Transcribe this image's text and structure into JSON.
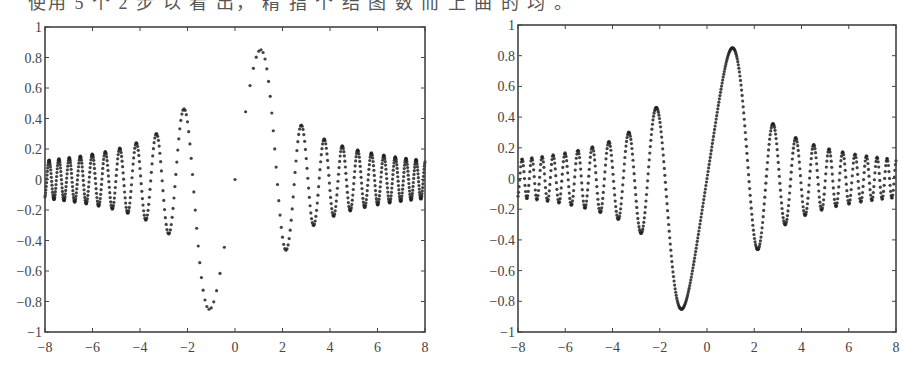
{
  "caption": "使用 5 个 2 步 以 看 出， 精 指 个 结 图 数 而 上 曲 的 均 。",
  "chart_data": [
    {
      "type": "scatter",
      "title": "",
      "xlabel": "",
      "ylabel": "",
      "function": "sin(x^2)/x",
      "sampling": "uniform-in-x-squared",
      "n_points": 640,
      "xlim": [
        -8,
        8
      ],
      "ylim": [
        -1,
        1
      ],
      "xticks": [
        -8,
        -6,
        -4,
        -2,
        0,
        2,
        4,
        6,
        8
      ],
      "yticks": [
        1,
        0.8,
        0.6,
        0.4,
        0.2,
        0,
        -0.2,
        -0.4,
        -0.6,
        -0.8,
        -1
      ],
      "ytick_labels": [
        "1",
        "0.8",
        "0.6",
        "0.4",
        "0.2",
        "0",
        "−0.2",
        "−0.4",
        "−0.6",
        "−0.8",
        "−1"
      ],
      "xtick_labels": [
        "−8",
        "−6",
        "−4",
        "−2",
        "0",
        "2",
        "4",
        "6",
        "8"
      ],
      "grid": false,
      "key_points": [
        {
          "x": -1.0,
          "y": -0.84
        },
        {
          "x": 1.0,
          "y": 0.86
        },
        {
          "x": -2.2,
          "y": 0.46
        },
        {
          "x": 2.1,
          "y": -0.45
        },
        {
          "x": -2.8,
          "y": -0.36
        },
        {
          "x": 2.7,
          "y": 0.36
        },
        {
          "x": -3.4,
          "y": 0.3
        },
        {
          "x": 3.3,
          "y": -0.3
        }
      ],
      "frame": {
        "left": 45,
        "top": 27,
        "right": 425,
        "bottom": 332
      }
    },
    {
      "type": "scatter",
      "title": "",
      "xlabel": "",
      "ylabel": "",
      "function": "sin(x^2)/x",
      "sampling": "uniform-in-x",
      "n_points": 700,
      "xlim": [
        -8,
        8
      ],
      "ylim": [
        -1,
        1
      ],
      "xticks": [
        -8,
        -6,
        -4,
        -2,
        0,
        2,
        4,
        6,
        8
      ],
      "yticks": [
        1,
        0.8,
        0.6,
        0.4,
        0.2,
        0,
        -0.2,
        -0.4,
        -0.6,
        -0.8,
        -1
      ],
      "ytick_labels": [
        "1",
        "0.8",
        "0.6",
        "0.4",
        "0.2",
        "0",
        "−0.2",
        "−0.4",
        "−0.6",
        "−0.8",
        "−1"
      ],
      "xtick_labels": [
        "−8",
        "−6",
        "−4",
        "−2",
        "0",
        "2",
        "4",
        "6",
        "8"
      ],
      "grid": false,
      "key_points": [
        {
          "x": -1.0,
          "y": -0.84
        },
        {
          "x": 1.0,
          "y": 0.86
        },
        {
          "x": -2.2,
          "y": 0.47
        },
        {
          "x": 2.1,
          "y": -0.45
        },
        {
          "x": -2.8,
          "y": -0.36
        },
        {
          "x": 2.7,
          "y": 0.36
        }
      ],
      "frame": {
        "left": 518,
        "top": 25,
        "right": 896,
        "bottom": 332
      }
    }
  ]
}
